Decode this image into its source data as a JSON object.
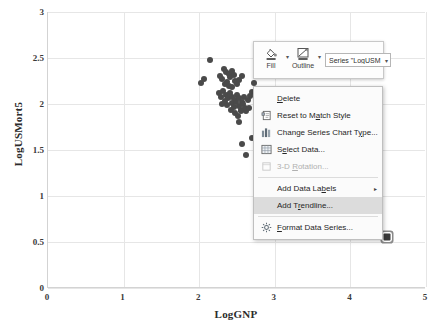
{
  "chart_data": {
    "type": "scatter",
    "title": "",
    "xlabel": "LogGNP",
    "ylabel": "LogUSMort5",
    "xlim": [
      0,
      5
    ],
    "ylim": [
      0,
      3
    ],
    "xticks": [
      "0",
      "1",
      "2",
      "3",
      "4",
      "5"
    ],
    "yticks": [
      "0",
      "0.5",
      "1",
      "1.5",
      "2",
      "2.5",
      "3"
    ],
    "grid": true,
    "legend": "none",
    "series_name": "LogUSMort5",
    "points": [
      [
        2.14,
        2.48
      ],
      [
        2.02,
        2.23
      ],
      [
        2.06,
        2.27
      ],
      [
        2.28,
        2.3
      ],
      [
        2.33,
        2.38
      ],
      [
        2.36,
        2.35
      ],
      [
        2.39,
        2.33
      ],
      [
        2.41,
        2.29
      ],
      [
        2.44,
        2.36
      ],
      [
        2.46,
        2.31
      ],
      [
        2.48,
        2.25
      ],
      [
        2.3,
        2.27
      ],
      [
        2.34,
        2.22
      ],
      [
        2.37,
        2.24
      ],
      [
        2.4,
        2.2
      ],
      [
        2.43,
        2.18
      ],
      [
        2.5,
        2.22
      ],
      [
        2.53,
        2.26
      ],
      [
        2.56,
        2.3
      ],
      [
        2.26,
        2.12
      ],
      [
        2.29,
        2.08
      ],
      [
        2.32,
        2.14
      ],
      [
        2.35,
        2.1
      ],
      [
        2.38,
        2.06
      ],
      [
        2.41,
        2.12
      ],
      [
        2.44,
        2.08
      ],
      [
        2.47,
        2.04
      ],
      [
        2.5,
        2.1
      ],
      [
        2.53,
        2.06
      ],
      [
        2.56,
        2.02
      ],
      [
        2.59,
        2.08
      ],
      [
        2.3,
        2.0
      ],
      [
        2.34,
        2.03
      ],
      [
        2.37,
        1.99
      ],
      [
        2.43,
        2.01
      ],
      [
        2.46,
        1.97
      ],
      [
        2.49,
        2.02
      ],
      [
        2.52,
        1.98
      ],
      [
        2.55,
        1.94
      ],
      [
        2.58,
        2.0
      ],
      [
        2.61,
        1.96
      ],
      [
        2.64,
        2.04
      ],
      [
        2.67,
        2.09
      ],
      [
        2.7,
        2.13
      ],
      [
        2.73,
        2.23
      ],
      [
        2.76,
        2.16
      ],
      [
        2.42,
        1.93
      ],
      [
        2.47,
        1.9
      ],
      [
        2.51,
        1.87
      ],
      [
        2.55,
        1.92
      ],
      [
        2.62,
        1.92
      ],
      [
        2.66,
        1.96
      ],
      [
        2.52,
        1.8
      ],
      [
        2.57,
        1.57
      ],
      [
        2.7,
        1.63
      ],
      [
        2.62,
        1.45
      ],
      [
        3.93,
        0.65
      ],
      [
        4.48,
        0.55
      ]
    ],
    "selected_point": [
      4.48,
      0.55
    ]
  },
  "mini_toolbar": {
    "fill": {
      "label": "Fill",
      "icon": "paint-bucket-icon"
    },
    "outline": {
      "label": "Outline",
      "icon": "pencil-outline-icon"
    },
    "series_selector": {
      "value": "Series \"LogUSM",
      "caret": "▾"
    },
    "caret": "▾"
  },
  "context_menu": {
    "items": [
      {
        "label": "Delete",
        "icon": "",
        "accel": "D",
        "enabled": true,
        "highlighted": false,
        "submenu": false
      },
      {
        "label": "Reset to Match Style",
        "icon": "reset-style-icon",
        "accel": "a",
        "enabled": true,
        "highlighted": false,
        "submenu": false
      },
      {
        "label": "Change Series Chart Type...",
        "icon": "chart-type-icon",
        "accel": "y",
        "enabled": true,
        "highlighted": false,
        "submenu": false
      },
      {
        "label": "Select Data...",
        "icon": "select-data-icon",
        "accel": "e",
        "enabled": true,
        "highlighted": false,
        "submenu": false
      },
      {
        "label": "3-D Rotation...",
        "icon": "rotation-icon",
        "accel": "R",
        "enabled": false,
        "highlighted": false,
        "submenu": false
      },
      {
        "label": "Add Data Labels",
        "icon": "",
        "accel": "b",
        "enabled": true,
        "highlighted": false,
        "submenu": true
      },
      {
        "label": "Add Trendline...",
        "icon": "",
        "accel": "r",
        "enabled": true,
        "highlighted": true,
        "submenu": false
      },
      {
        "label": "Format Data Series...",
        "icon": "format-series-icon",
        "accel": "F",
        "enabled": true,
        "highlighted": false,
        "submenu": false
      }
    ],
    "submenu_arrow": "▸"
  },
  "colors": {
    "marker": "#4a4a4a",
    "gridline": "#e6e6e6",
    "axis": "#d3d3d3",
    "menu_bg": "#fbfbfb",
    "menu_highlight": "#dcdcdc",
    "text": "#262626",
    "disabled_text": "#b0b0b0"
  }
}
